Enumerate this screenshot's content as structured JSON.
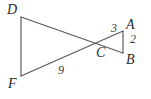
{
  "figure": {
    "kind": "geometry-diagram",
    "canvas": {
      "width": 151,
      "height": 99,
      "background": "#ffffff"
    },
    "stroke_color": "#58585a",
    "label_color": "#2b2b2d",
    "points": {
      "D": {
        "label": "D",
        "x": 21,
        "y": 17
      },
      "F": {
        "label": "F",
        "x": 21,
        "y": 76
      },
      "C": {
        "label": "C",
        "x": 100,
        "y": 42
      },
      "A": {
        "label": "A",
        "x": 123,
        "y": 31
      },
      "B": {
        "label": "B",
        "x": 123,
        "y": 53
      }
    },
    "segments": [
      {
        "name": "DF",
        "from": "D",
        "to": "F"
      },
      {
        "name": "DB",
        "from": "D",
        "to": "B"
      },
      {
        "name": "FA",
        "from": "F",
        "to": "A"
      },
      {
        "name": "AB",
        "from": "A",
        "to": "B"
      }
    ],
    "measures": {
      "CA": "3",
      "AB": "2",
      "FC": "9"
    }
  }
}
